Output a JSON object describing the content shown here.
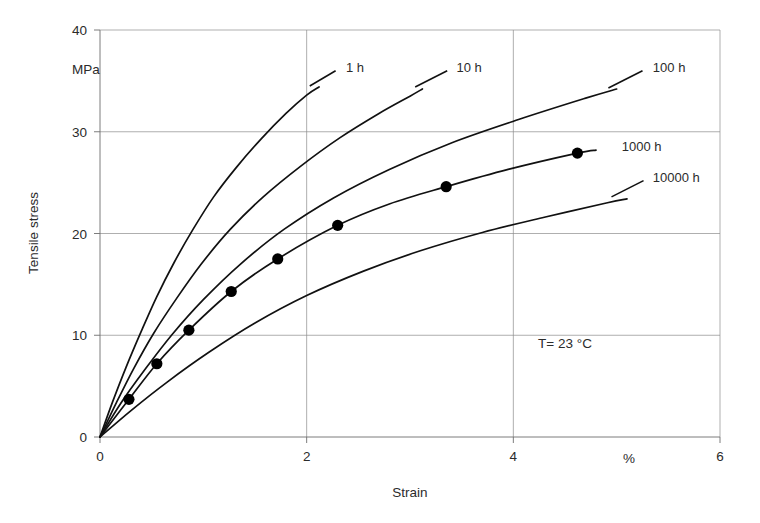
{
  "figure": {
    "background_color": "#ffffff",
    "line_color": "#111111",
    "grid_color": "#8c8c8c",
    "axis_color": "#6e6e6e"
  },
  "chart_data": {
    "type": "line",
    "title": "",
    "subtitle": "",
    "xlabel": "Strain",
    "ylabel": "Tensile stress",
    "x_unit": "%",
    "y_unit": "MPa",
    "xlim": [
      0,
      6
    ],
    "ylim": [
      0,
      40
    ],
    "xticks": [
      0,
      2,
      4,
      6
    ],
    "xtick_labels": [
      "0",
      "2",
      "4",
      "6"
    ],
    "yticks": [
      0,
      10,
      20,
      30,
      40
    ],
    "ytick_labels": [
      "0",
      "10",
      "20",
      "30",
      "40"
    ],
    "grid": true,
    "grid_x_values": [
      2,
      4
    ],
    "grid_y_values": [
      10,
      20,
      30
    ],
    "legend_position": "inline-curve-labels",
    "annotations": [
      {
        "name": "temperature",
        "text": "T=  23 °C",
        "x": 4.5,
        "y": 9.2
      },
      {
        "name": "x-unit",
        "text": "%",
        "x": 5.12,
        "y": -2.1
      },
      {
        "name": "y-unit",
        "text": "MPa",
        "x": -0.27,
        "y": 36.2
      }
    ],
    "marker_series": "1000 h",
    "markers": [
      {
        "x": 0.28,
        "y": 3.7
      },
      {
        "x": 0.55,
        "y": 7.2
      },
      {
        "x": 0.86,
        "y": 10.5
      },
      {
        "x": 1.27,
        "y": 14.3
      },
      {
        "x": 1.72,
        "y": 17.5
      },
      {
        "x": 2.3,
        "y": 20.8
      },
      {
        "x": 3.35,
        "y": 24.6
      },
      {
        "x": 4.62,
        "y": 27.9
      }
    ],
    "series": [
      {
        "name": "1 h",
        "label": "1 h",
        "label_x": 2.38,
        "label_y": 36.4,
        "leader_from": {
          "x": 2.03,
          "y": 34.5
        },
        "leader_to": {
          "x": 2.28,
          "y": 36.0
        },
        "x": [
          0,
          0.12,
          0.25,
          0.4,
          0.55,
          0.72,
          0.9,
          1.1,
          1.32,
          1.56,
          1.8,
          2.0,
          2.12
        ],
        "y": [
          0,
          3.4,
          6.8,
          10.4,
          13.8,
          17.2,
          20.4,
          23.6,
          26.5,
          29.3,
          31.8,
          33.6,
          34.4
        ]
      },
      {
        "name": "10 h",
        "label": "10 h",
        "label_x": 3.45,
        "label_y": 36.4,
        "leader_from": {
          "x": 3.05,
          "y": 34.4
        },
        "leader_to": {
          "x": 3.36,
          "y": 36.0
        },
        "x": [
          0,
          0.16,
          0.33,
          0.52,
          0.74,
          0.98,
          1.26,
          1.58,
          1.94,
          2.32,
          2.7,
          3.0,
          3.12
        ],
        "y": [
          0,
          3.4,
          6.8,
          10.2,
          13.6,
          17.0,
          20.4,
          23.6,
          26.6,
          29.4,
          31.8,
          33.5,
          34.2
        ]
      },
      {
        "name": "100 h",
        "label": "100 h",
        "label_x": 5.35,
        "label_y": 36.4,
        "leader_from": {
          "x": 4.92,
          "y": 34.3
        },
        "leader_to": {
          "x": 5.25,
          "y": 36.0
        },
        "x": [
          0,
          0.2,
          0.44,
          0.7,
          1.0,
          1.36,
          1.78,
          2.26,
          2.8,
          3.4,
          4.05,
          4.7,
          5.0
        ],
        "y": [
          0,
          3.3,
          6.7,
          10.1,
          13.5,
          17.0,
          20.4,
          23.5,
          26.3,
          28.9,
          31.2,
          33.3,
          34.2
        ]
      },
      {
        "name": "1000 h",
        "label": "1000 h",
        "label_x": 5.05,
        "label_y": 28.6,
        "leader_from": null,
        "leader_to": null,
        "x": [
          0,
          0.28,
          0.55,
          0.86,
          1.27,
          1.72,
          2.3,
          2.8,
          3.35,
          3.95,
          4.62,
          4.8
        ],
        "y": [
          0,
          3.7,
          7.2,
          10.5,
          14.3,
          17.5,
          20.8,
          22.9,
          24.6,
          26.3,
          27.9,
          28.2
        ]
      },
      {
        "name": "10000 h",
        "label": "10000 h",
        "label_x": 5.35,
        "label_y": 25.6,
        "leader_from": {
          "x": 4.95,
          "y": 23.6
        },
        "leader_to": {
          "x": 5.26,
          "y": 25.2
        },
        "x": [
          0,
          0.3,
          0.65,
          1.05,
          1.5,
          2.0,
          2.55,
          3.1,
          3.7,
          4.3,
          4.9,
          5.1
        ],
        "y": [
          0,
          2.6,
          5.4,
          8.3,
          11.2,
          13.9,
          16.3,
          18.3,
          20.1,
          21.6,
          23.0,
          23.4
        ]
      }
    ]
  }
}
